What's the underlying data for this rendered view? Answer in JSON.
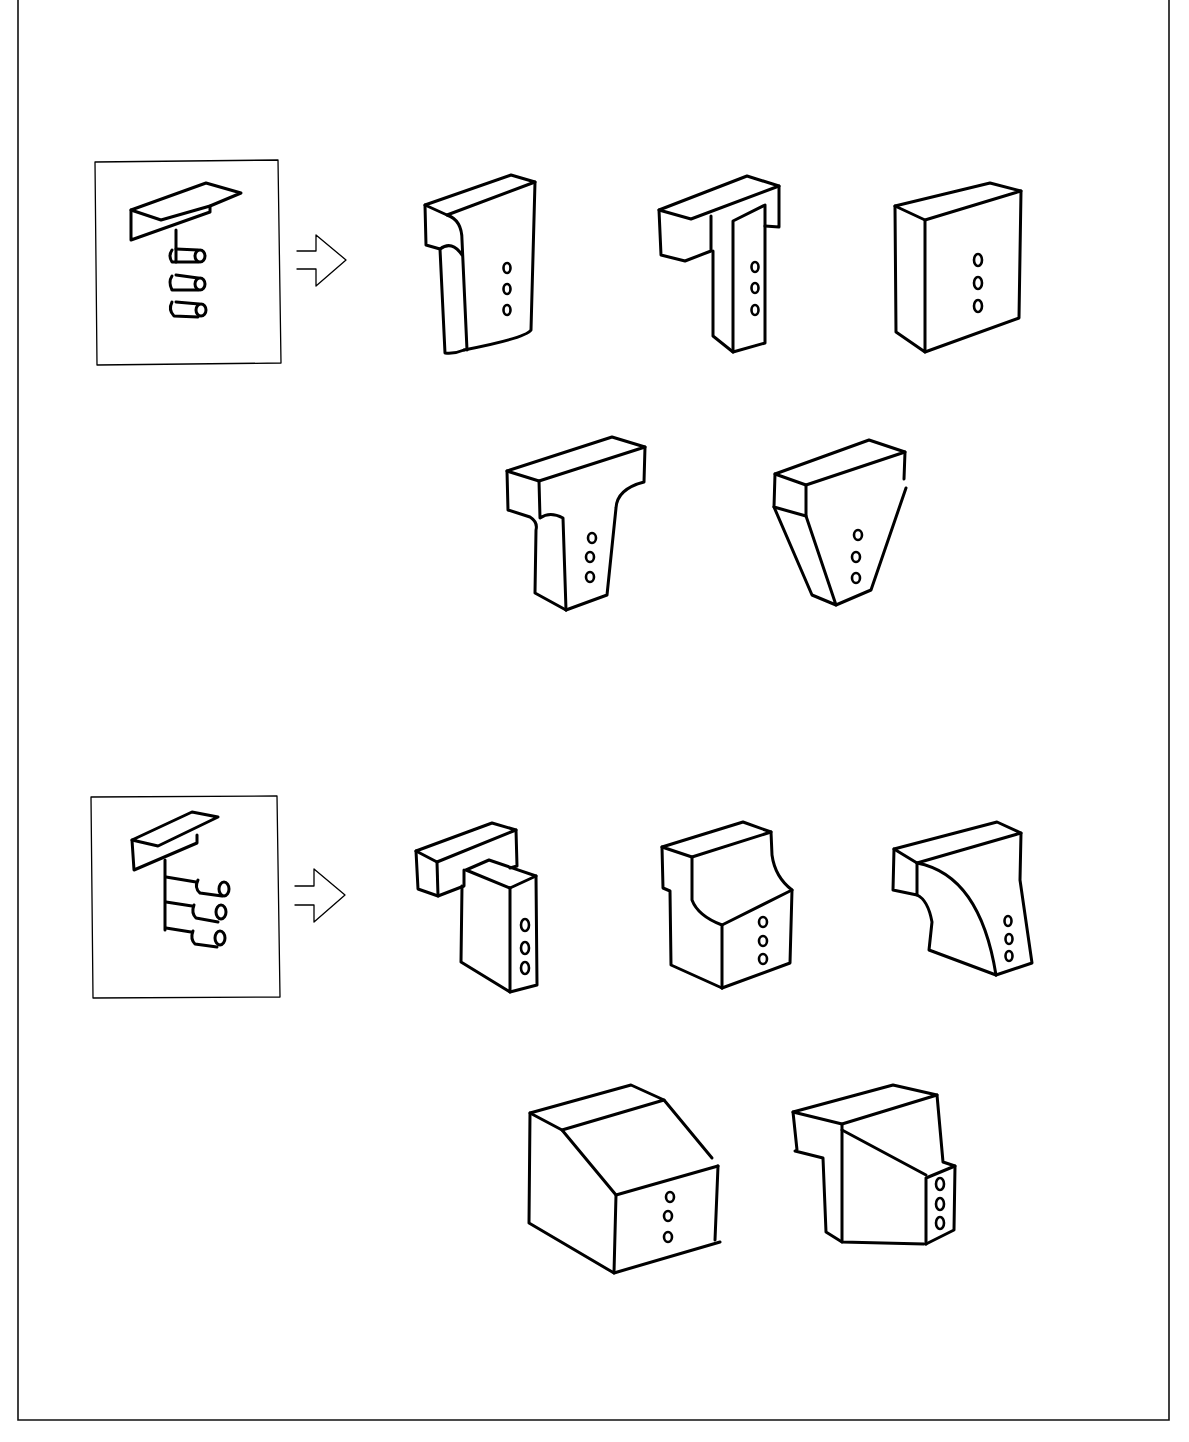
{
  "diagram": {
    "type": "hand-drawn sketch sheet",
    "ink_color": "#000000",
    "paper_color": "#ffffff",
    "rows": [
      {
        "id": "row-1",
        "source": {
          "label": "beam-with-3-vertically-stacked-pipes",
          "description": "T-profile beam with three pipes stacked along a vertical stem"
        },
        "arrow": "outline-right-arrow",
        "variants": [
          {
            "id": "variant-1-1",
            "shape": "T-block with rounded inner corner",
            "holes": 3
          },
          {
            "id": "variant-1-2",
            "shape": "T-block with square stem",
            "holes": 3
          },
          {
            "id": "variant-1-3",
            "shape": "solid rectangular block",
            "holes": 3
          },
          {
            "id": "variant-1-4",
            "shape": "T-block with curved fillet transitions",
            "holes": 3
          },
          {
            "id": "variant-1-5",
            "shape": "tapered trapezoidal block",
            "holes": 3
          }
        ]
      },
      {
        "id": "row-2",
        "source": {
          "label": "beam-with-3-horizontal-pipes",
          "description": "Beam with three pipes projecting horizontally from a vertical stem"
        },
        "arrow": "outline-right-arrow",
        "variants": [
          {
            "id": "variant-2-1",
            "shape": "beam offset over wide block",
            "holes": 3
          },
          {
            "id": "variant-2-2",
            "shape": "block with concave curved step",
            "holes": 3
          },
          {
            "id": "variant-2-3",
            "shape": "bracket with curved haunch",
            "holes": 3
          },
          {
            "id": "variant-2-4",
            "shape": "block with sloped top",
            "holes": 3
          },
          {
            "id": "variant-2-5",
            "shape": "stepped block with diagonal face",
            "holes": 3
          }
        ]
      }
    ]
  }
}
